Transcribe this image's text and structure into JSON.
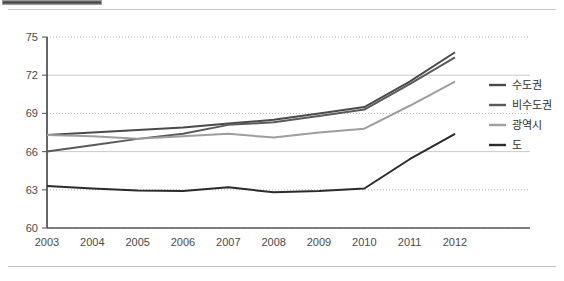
{
  "chart_data": {
    "type": "line",
    "title": "",
    "subtitle": "",
    "xlabel": "",
    "ylabel": "",
    "categories": [
      "2003",
      "2004",
      "2005",
      "2006",
      "2007",
      "2008",
      "2009",
      "2010",
      "2011",
      "2012"
    ],
    "x": [
      2003,
      2004,
      2005,
      2006,
      2007,
      2008,
      2009,
      2010,
      2011,
      2012
    ],
    "ylim": [
      60,
      75
    ],
    "yticks": [
      60,
      63,
      66,
      69,
      72,
      75
    ],
    "ytick_labels": [
      "60",
      "63",
      "66",
      "69",
      "72",
      "75"
    ],
    "grid": true,
    "grid_axis": "y",
    "legend_position": "right",
    "series": [
      {
        "name": "수도권",
        "color": "#4a4a4a",
        "values": [
          67.3,
          67.5,
          67.7,
          67.9,
          68.2,
          68.5,
          69.0,
          69.5,
          71.5,
          73.8
        ]
      },
      {
        "name": "비수도권",
        "color": "#5a5a5a",
        "values": [
          66.0,
          66.5,
          67.0,
          67.4,
          68.1,
          68.3,
          68.8,
          69.3,
          71.3,
          73.4
        ]
      },
      {
        "name": "광역시",
        "color": "#9e9e9e",
        "values": [
          67.3,
          67.2,
          67.0,
          67.2,
          67.4,
          67.1,
          67.5,
          67.8,
          69.6,
          71.5
        ]
      },
      {
        "name": "도",
        "color": "#2b2b2b",
        "values": [
          63.3,
          63.1,
          62.95,
          62.9,
          63.2,
          62.8,
          62.9,
          63.1,
          65.4,
          67.4
        ]
      }
    ]
  },
  "legend": {
    "items": [
      {
        "label": "수도권",
        "color": "#4a4a4a"
      },
      {
        "label": "비수도권",
        "color": "#5a5a5a"
      },
      {
        "label": "광역시",
        "color": "#9e9e9e"
      },
      {
        "label": "도",
        "color": "#2b2b2b"
      }
    ]
  },
  "colors": {
    "gridline": "#b9b9b9",
    "axis": "#555555",
    "text": "#4a4a4a",
    "background": "#ffffff"
  }
}
